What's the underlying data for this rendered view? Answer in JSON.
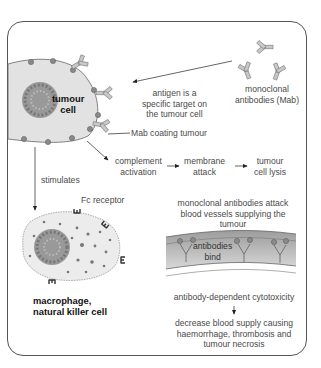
{
  "diagram": {
    "nodes": {
      "tumour_cell": {
        "line1": "tumour",
        "line2": "cell"
      },
      "mab": {
        "line1": "monoclonal",
        "line2": "antibodies (Mab)"
      },
      "antigen_note": {
        "line1": "antigen is a",
        "line2": "specific target on",
        "line3": "the tumour cell"
      },
      "mab_coating": "Mab coating tumour",
      "complement": {
        "line1": "complement",
        "line2": "activation"
      },
      "membrane": {
        "line1": "membrane",
        "line2": "attack"
      },
      "lysis": {
        "line1": "tumour",
        "line2": "cell lysis"
      },
      "stimulates": "stimulates",
      "fc_receptor": "Fc receptor",
      "effector_cell": {
        "line1": "macrophage,",
        "line2": "natural killer cell"
      },
      "vessel_note": {
        "line1": "monoclonal antibodies attack",
        "line2": "blood vessels supplying the",
        "line3": "tumour"
      },
      "antibodies_bind": {
        "line1": "antibodies",
        "line2": "bind"
      },
      "adcc": "antibody-dependent cytotoxicity",
      "outcome": {
        "line1": "decrease blood supply causing",
        "line2": "haemorrhage, thrombosis and",
        "line3": "tumour necrosis"
      }
    },
    "edges": [
      {
        "from": "mab",
        "to": "tumour_cell"
      },
      {
        "from": "tumour_cell",
        "to": "complement"
      },
      {
        "from": "complement",
        "to": "membrane"
      },
      {
        "from": "membrane",
        "to": "lysis"
      },
      {
        "from": "tumour_cell",
        "to": "effector_cell",
        "label": "stimulates"
      },
      {
        "from": "adcc",
        "to": "outcome"
      }
    ],
    "colors": {
      "cell_fill": "#e2e2e2",
      "outline": "#555555",
      "dot": "#8a8a8a",
      "vessel_fill": "#b8b8b8",
      "antibody": "#a0a0a0"
    }
  }
}
